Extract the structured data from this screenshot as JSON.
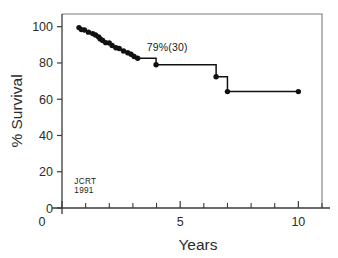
{
  "chart_data": {
    "type": "line",
    "title": "",
    "subtitle": "",
    "xlabel": "Years",
    "ylabel": "% Survival",
    "xlim": [
      0,
      11
    ],
    "ylim": [
      0,
      107
    ],
    "grid": false,
    "legend": null,
    "x_ticks": [
      0,
      5,
      10
    ],
    "x_tick_labels": [
      "0",
      "5",
      "10"
    ],
    "x_minor_ticks": [
      1,
      2,
      3,
      4,
      6,
      7,
      8,
      9,
      11
    ],
    "y_ticks": [
      0,
      20,
      40,
      60,
      80,
      100
    ],
    "y_tick_labels": [
      "0",
      "20",
      "40",
      "60",
      "80",
      "100"
    ],
    "series": [
      {
        "name": "Survival",
        "style": "kaplan-meier-step",
        "x": [
          0.72,
          0.82,
          0.95,
          1.12,
          1.3,
          1.42,
          1.55,
          1.62,
          1.72,
          1.85,
          2.0,
          2.12,
          2.28,
          2.42,
          2.6,
          2.78,
          2.92,
          3.05,
          3.2,
          3.98,
          3.98,
          6.52,
          6.52,
          7.0,
          7.0,
          10.0
        ],
        "y": [
          99.5,
          98.4,
          98.2,
          97.0,
          96.2,
          95.4,
          94.3,
          93.2,
          92.4,
          91.0,
          91.0,
          89.6,
          88.4,
          88.0,
          86.6,
          85.6,
          84.8,
          83.6,
          82.6,
          82.6,
          79.0,
          79.0,
          72.4,
          72.4,
          64.2,
          64.2
        ]
      }
    ],
    "markers": [
      {
        "x": 0.72,
        "y": 99.5
      },
      {
        "x": 0.82,
        "y": 98.4
      },
      {
        "x": 0.95,
        "y": 98.2
      },
      {
        "x": 1.12,
        "y": 97.0
      },
      {
        "x": 1.3,
        "y": 96.2
      },
      {
        "x": 1.42,
        "y": 95.4
      },
      {
        "x": 1.55,
        "y": 94.3
      },
      {
        "x": 1.62,
        "y": 93.2
      },
      {
        "x": 1.72,
        "y": 92.4
      },
      {
        "x": 1.85,
        "y": 91.2
      },
      {
        "x": 2.0,
        "y": 91.0
      },
      {
        "x": 2.12,
        "y": 89.6
      },
      {
        "x": 2.28,
        "y": 88.4
      },
      {
        "x": 2.42,
        "y": 88.0
      },
      {
        "x": 2.6,
        "y": 86.6
      },
      {
        "x": 2.78,
        "y": 85.6
      },
      {
        "x": 2.92,
        "y": 84.8
      },
      {
        "x": 3.05,
        "y": 83.6
      },
      {
        "x": 3.2,
        "y": 82.6
      },
      {
        "x": 3.98,
        "y": 79.0
      },
      {
        "x": 6.52,
        "y": 72.4
      },
      {
        "x": 7.0,
        "y": 64.2
      },
      {
        "x": 10.0,
        "y": 64.2
      }
    ],
    "annotations": [
      {
        "name": "survival-callout",
        "text": "79%(30)",
        "x": 4.45,
        "y": 86.5,
        "value_pct": 79,
        "n": 30
      },
      {
        "name": "source-stamp-line1",
        "text": "JCRT",
        "x": 0.52,
        "y": 13.5
      },
      {
        "name": "source-stamp-line2",
        "text": "1991",
        "x": 0.52,
        "y": 8.0
      }
    ],
    "colors": {
      "curve": "#111111",
      "marker": "#111111",
      "axis": "#3a3a3a",
      "frame": "#7a7a7a",
      "text": "#2b2b2b",
      "background": "#ffffff"
    }
  }
}
